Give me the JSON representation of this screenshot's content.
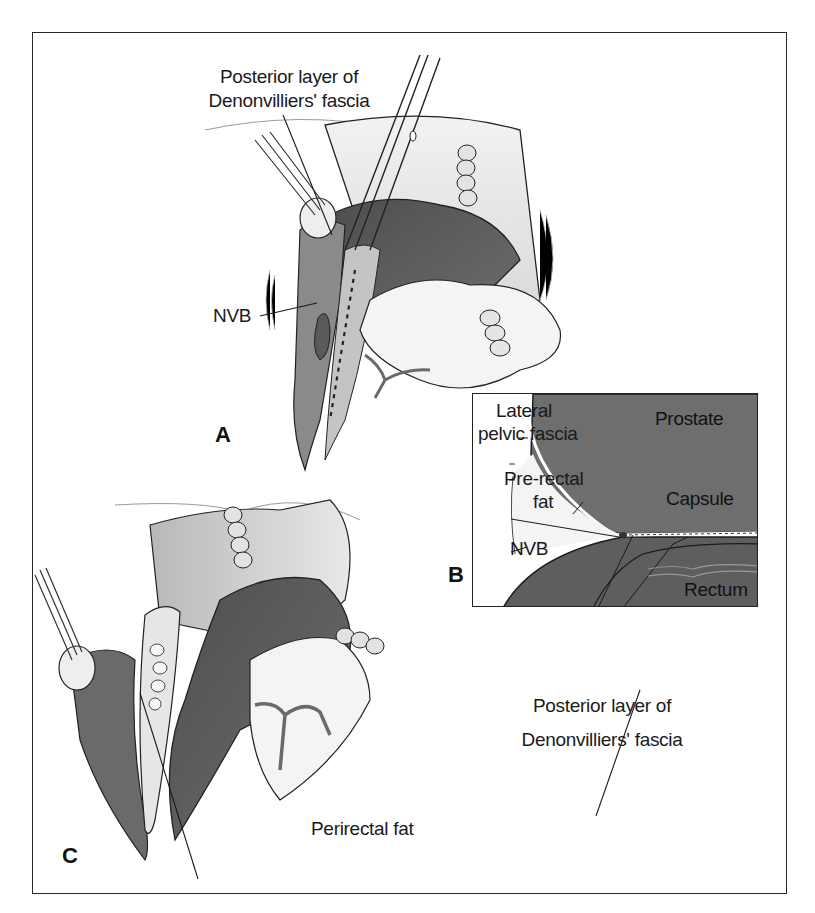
{
  "figure": {
    "panels": [
      {
        "id": "A",
        "letter": "A",
        "labels": {
          "posterior_layer_line1": "Posterior layer of",
          "posterior_layer_line2": "Denonvilliers' fascia",
          "nvb": "NVB"
        }
      },
      {
        "id": "B",
        "letter": "B",
        "labels": {
          "lateral_line1": "Lateral",
          "lateral_line2": "pelvic fascia",
          "prostate": "Prostate",
          "prerectal_line1": "Pre-rectal",
          "prerectal_line2": "fat",
          "capsule": "Capsule",
          "nvb": "NVB",
          "rectum": "Rectum",
          "posterior_layer_line1": "Posterior layer of",
          "posterior_layer_line2": "Denonvilliers' fascia"
        }
      },
      {
        "id": "C",
        "letter": "C",
        "labels": {
          "perirectal_fat": "Perirectal fat"
        }
      }
    ],
    "colors": {
      "dark_tissue": "#5e5e5e",
      "mid_tissue": "#9a9a9a",
      "light_tissue": "#d4d4d4",
      "line": "#1a1a1a",
      "background": "#ffffff"
    }
  }
}
